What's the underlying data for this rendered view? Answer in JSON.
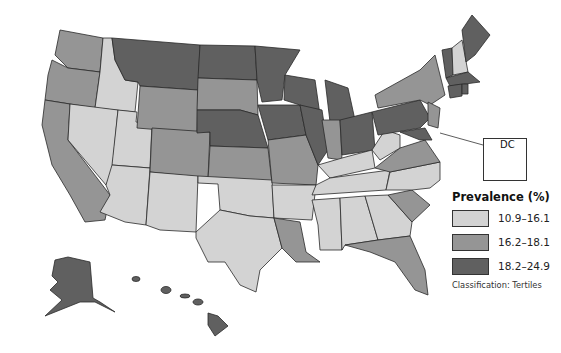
{
  "legend": {
    "title": "Prevalence (%)",
    "items": [
      {
        "label": "10.9–16.1",
        "color": "#d3d3d3"
      },
      {
        "label": "16.2–18.1",
        "color": "#959595"
      },
      {
        "label": "18.2–24.9",
        "color": "#606060"
      }
    ],
    "note": "Classification: Tertiles"
  },
  "inset": {
    "label": "DC"
  },
  "states": {
    "light": [
      "ID",
      "NV",
      "UT",
      "AZ",
      "NM",
      "TX",
      "OK",
      "AR",
      "MS",
      "AL",
      "GA",
      "TN",
      "KY",
      "WV",
      "NC",
      "NH"
    ],
    "medium": [
      "WA",
      "OR",
      "CA",
      "WY",
      "CO",
      "SD",
      "KS",
      "MO",
      "LA",
      "IN",
      "VA",
      "SC",
      "FL",
      "NY",
      "NJ",
      "DE"
    ],
    "dark": [
      "MT",
      "ND",
      "NE",
      "MN",
      "IA",
      "WI",
      "IL",
      "MI",
      "OH",
      "PA",
      "ME",
      "VT",
      "MA",
      "CT",
      "RI",
      "MD",
      "AK",
      "HI",
      "DC"
    ]
  }
}
